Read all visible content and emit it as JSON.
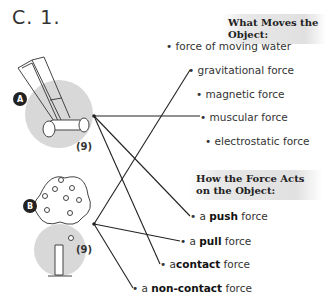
{
  "question": {
    "label": "C.  1."
  },
  "section_what": {
    "title": "What Moves the Object:",
    "options": [
      "force of moving water",
      "gravitational force",
      "magnetic force",
      "muscular force",
      "electrostatic force"
    ]
  },
  "section_how": {
    "title_line1": "How the Force Acts",
    "title_line2": "on the Object:",
    "options": [
      {
        "pre": "a ",
        "bold": "push",
        "post": " force"
      },
      {
        "pre": "a ",
        "bold": "pull",
        "post": " force"
      },
      {
        "pre": "a",
        "bold": "contact",
        "post": " force"
      },
      {
        "pre": "a ",
        "bold": "non-contact",
        "post": " force"
      }
    ]
  },
  "items": [
    {
      "badge": "A",
      "image": "push-lawn-mower",
      "score": "(9)"
    },
    {
      "badge": "B",
      "image": "apple-tree",
      "score": "(9)"
    }
  ],
  "connections": [
    {
      "from": "A",
      "to": "muscular force"
    },
    {
      "from": "A",
      "to": "a push force"
    },
    {
      "from": "A",
      "to": "a contact force"
    },
    {
      "from": "B",
      "to": "gravitational force"
    },
    {
      "from": "B",
      "to": "a pull force"
    },
    {
      "from": "B",
      "to": "a non-contact force"
    }
  ]
}
